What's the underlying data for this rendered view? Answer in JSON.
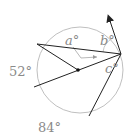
{
  "diagram": {
    "type": "circle-geometry",
    "circle": {
      "cx": 80,
      "cy": 70,
      "r": 43,
      "color": "#b8b8b8"
    },
    "center_point": {
      "x": 78,
      "y": 70
    },
    "points": {
      "vertex": {
        "x": 121,
        "y": 54
      },
      "upper_left": {
        "x": 37,
        "y": 44
      },
      "lower_left": {
        "x": 34,
        "y": 87
      },
      "bottom": {
        "x": 89,
        "y": 116
      },
      "arrow_tip": {
        "x": 107,
        "y": 13
      }
    },
    "labels": {
      "a": "a°",
      "b": "b°",
      "c": "c°",
      "arc_left": "52°",
      "arc_bottom": "84°"
    },
    "colors": {
      "line": "#222222",
      "label": "#8a8a8a",
      "circle": "#b8b8b8"
    }
  }
}
